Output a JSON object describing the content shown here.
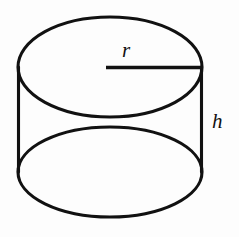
{
  "figure": {
    "name": "cylinder-diagram",
    "background_color": "#fdfdfd",
    "stroke_color": "#111111",
    "canvas": {
      "width": 239,
      "height": 237
    }
  },
  "labels": {
    "radius": "r",
    "height": "h"
  },
  "geometry": {
    "top_ellipse": {
      "cx": 110,
      "cy": 67,
      "rx": 92,
      "ry": 50
    },
    "bottom_ellipse": {
      "cx": 110,
      "cy": 172,
      "rx": 92,
      "ry": 45
    },
    "left_side_line": {
      "x1": 18,
      "y1": 67,
      "x2": 18,
      "y2": 172
    },
    "right_side_line": {
      "x1": 202,
      "y1": 67,
      "x2": 202,
      "y2": 172
    },
    "radius_line": {
      "x1": 106,
      "y1": 67,
      "x2": 202,
      "y2": 67
    },
    "radius_label_pos": {
      "x": 122,
      "y": 56
    },
    "height_label_pos": {
      "x": 212,
      "y": 127
    }
  }
}
